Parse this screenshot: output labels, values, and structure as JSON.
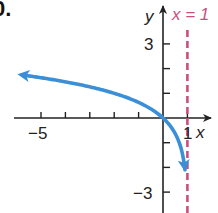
{
  "exercise_label": "0.",
  "chart_data": {
    "type": "line",
    "title": "",
    "function": "y = log3(1 - x)",
    "xlabel": "x",
    "ylabel": "y",
    "xlim": [
      -5.7,
      1.9
    ],
    "ylim": [
      -3.8,
      4.5
    ],
    "x_ticks": [
      -5,
      -4,
      -3,
      -2,
      -1,
      1
    ],
    "y_ticks": [
      3,
      2,
      1,
      -1,
      -2,
      -3
    ],
    "x_tick_labels": [
      {
        "value": -5,
        "text": "−5"
      },
      {
        "value": 1,
        "text": "1"
      }
    ],
    "y_tick_labels": [
      {
        "value": 3,
        "text": "3"
      },
      {
        "value": -3,
        "text": "−3"
      }
    ],
    "grid": false,
    "series": [
      {
        "name": "curve",
        "color": "#3a8fd6",
        "x_start": -5.6,
        "x_end": 0.9,
        "arrows": "both"
      }
    ],
    "asymptote": {
      "x": 1,
      "label": "x = 1",
      "color": "#c9507e",
      "style": "dashed"
    }
  }
}
